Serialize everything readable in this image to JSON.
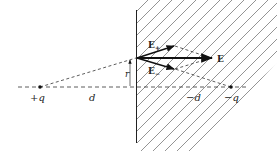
{
  "diagram": {
    "colors": {
      "line": "#222222",
      "hatch": "#555555",
      "background": "#ffffff"
    },
    "labels": {
      "plus_q": "+q",
      "minus_q": "−q",
      "d_left": "d",
      "d_right": "−d",
      "r": "r",
      "E_plus": "E",
      "E_plus_sub": "+",
      "E_minus": "E",
      "E_minus_sub": "−",
      "E": "E"
    }
  }
}
